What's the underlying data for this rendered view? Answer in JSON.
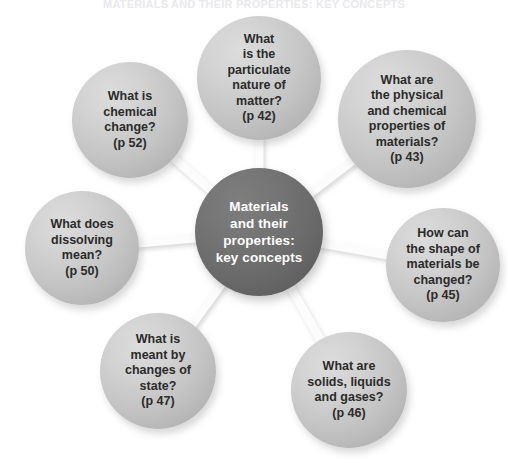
{
  "page": {
    "running_head": "MATERIALS AND THEIR PROPERTIES: KEY CONCEPTS",
    "background_color": "#ffffff",
    "width": 508,
    "height": 463
  },
  "diagram": {
    "type": "mind-map",
    "center": {
      "label": "Materials\nand their\nproperties:\nkey concepts",
      "text_color": "#ffffff",
      "fill_color": "#6a6a6a",
      "cx": 259,
      "cy": 232,
      "r": 64
    },
    "nodes": [
      {
        "id": "particulate-nature",
        "label": "What\nis the\nparticulate\nnature of\nmatter?\n(p 42)",
        "page_ref": "p 42",
        "cx": 259,
        "cy": 78,
        "r": 62,
        "fill_color": "#c8c8c8",
        "text_color": "#2b2b2b"
      },
      {
        "id": "physical-chemical-properties",
        "label": "What are\nthe physical\nand chemical\nproperties of\nmaterials?\n(p 43)",
        "page_ref": "p 43",
        "cx": 407,
        "cy": 119,
        "r": 69,
        "fill_color": "#c8c8c8",
        "text_color": "#2b2b2b"
      },
      {
        "id": "shape-changed",
        "label": "How can\nthe shape of\nmaterials be\nchanged?\n(p 45)",
        "page_ref": "p 45",
        "cx": 443,
        "cy": 265,
        "r": 57,
        "fill_color": "#c8c8c8",
        "text_color": "#2b2b2b"
      },
      {
        "id": "solids-liquids-gases",
        "label": "What are\nsolids, liquids\nand gases?\n(p 46)",
        "page_ref": "p 46",
        "cx": 349,
        "cy": 390,
        "r": 58,
        "fill_color": "#c8c8c8",
        "text_color": "#2b2b2b"
      },
      {
        "id": "changes-of-state",
        "label": "What is\nmeant by\nchanges of\nstate?\n(p 47)",
        "page_ref": "p 47",
        "cx": 158,
        "cy": 371,
        "r": 58,
        "fill_color": "#c8c8c8",
        "text_color": "#2b2b2b"
      },
      {
        "id": "dissolving",
        "label": "What does\ndissolving\nmean?\n(p 50)",
        "page_ref": "p 50",
        "cx": 82,
        "cy": 248,
        "r": 57,
        "fill_color": "#c8c8c8",
        "text_color": "#2b2b2b"
      },
      {
        "id": "chemical-change",
        "label": "What is\nchemical\nchange?\n(p 52)",
        "page_ref": "p 52",
        "cx": 130,
        "cy": 120,
        "r": 58,
        "fill_color": "#c8c8c8",
        "text_color": "#2b2b2b"
      }
    ],
    "connectors": {
      "color": "#fbfbfb",
      "shadow_color": "#d6d6d6",
      "count": 7
    }
  }
}
